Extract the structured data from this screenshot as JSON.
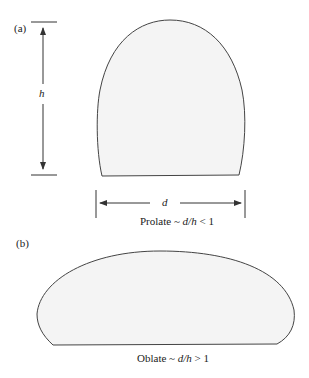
{
  "panel_a": {
    "label": "(a)",
    "height_symbol": "h",
    "width_symbol": "d",
    "caption_prefix": "Prolate ~ ",
    "caption_ratio": "d/h",
    "caption_suffix": " < 1"
  },
  "panel_b": {
    "label": "(b)",
    "caption_prefix": "Oblate ~ ",
    "caption_ratio": "d/h",
    "caption_suffix": " > 1"
  },
  "colors": {
    "shape_fill": "#f4f4f4",
    "stroke": "#444444"
  }
}
